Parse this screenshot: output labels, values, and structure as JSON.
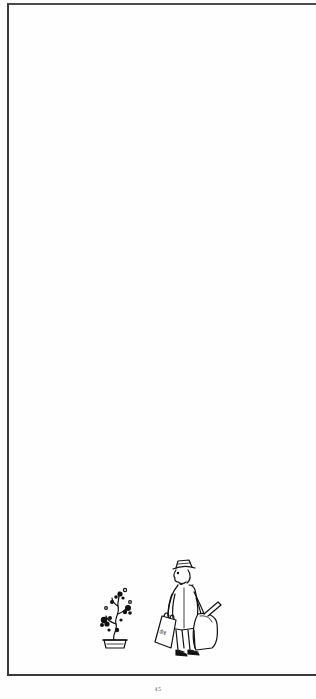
{
  "page": {
    "background": "#fefefe",
    "frame_color": "#3a3a3a",
    "page_number": "45"
  },
  "illustration": {
    "subjects": [
      "bonsai-tree-in-pot",
      "man-in-hat-with-luggage"
    ],
    "bag_label": "ऊँड़"
  }
}
